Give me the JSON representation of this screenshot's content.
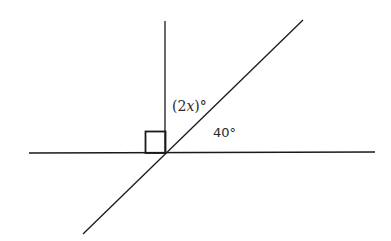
{
  "diagram": {
    "type": "geometry-angles",
    "labels": {
      "angle_upper": {
        "open": "(2",
        "var": "x",
        "close": ")°"
      },
      "angle_lower": "40°"
    },
    "right_angle_marker": true,
    "colors": {
      "line": "#1a1a1a",
      "text": "#2a2a2a",
      "background": "#ffffff"
    }
  }
}
